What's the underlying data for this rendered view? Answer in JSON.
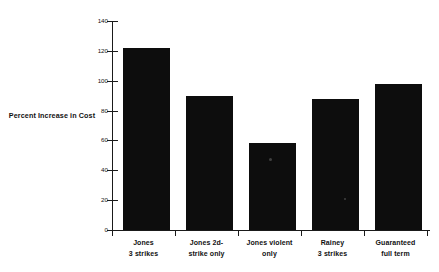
{
  "figure": {
    "y_axis_title_line1": "Percent Increase",
    "y_axis_title_line2": "in Cost"
  },
  "chart_data": {
    "type": "bar",
    "title": "",
    "xlabel": "",
    "ylabel": "Percent Increase in Cost",
    "categories": [
      "Jones 3 strikes",
      "Jones 2d-strike only",
      "Jones violent only",
      "Rainey 3 strikes",
      "Guaranteed full term"
    ],
    "category_lines": [
      [
        "Jones",
        "3 strikes"
      ],
      [
        "Jones 2d-",
        "strike only"
      ],
      [
        "Jones violent",
        "only"
      ],
      [
        "Rainey",
        "3 strikes"
      ],
      [
        "Guaranteed",
        "full term"
      ]
    ],
    "values": [
      122,
      90,
      58,
      88,
      98
    ],
    "ylim": [
      0,
      140
    ],
    "ytick_labels": [
      "0",
      "20",
      "40",
      "60",
      "80",
      "100",
      "120",
      "140"
    ],
    "ytick_values": [
      0,
      20,
      40,
      60,
      80,
      100,
      120,
      140
    ],
    "grid": false,
    "legend": "none",
    "bar_color": "#0d0d0d",
    "axis_color": "#1a1a1a",
    "background_color": "#ffffff"
  }
}
